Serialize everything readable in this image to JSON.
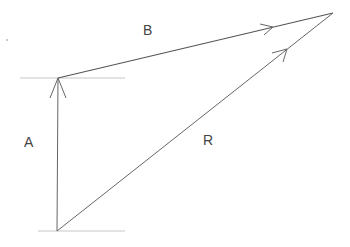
{
  "diagram": {
    "colors": {
      "vector": "#555555",
      "guide": "#bbbbbb",
      "text": "#444444"
    },
    "points": {
      "origin": [
        57,
        231
      ],
      "a_tip": [
        58,
        78
      ],
      "apex": [
        333,
        13
      ]
    },
    "vectors": [
      {
        "id": "A",
        "label": "A",
        "from": "origin",
        "to": "a_tip",
        "label_pos": [
          29,
          142
        ]
      },
      {
        "id": "B",
        "label": "B",
        "from": "a_tip",
        "to": "apex",
        "label_pos": [
          148,
          30
        ]
      },
      {
        "id": "R",
        "label": "R",
        "from": "origin",
        "to": "apex",
        "label_pos": [
          208,
          140
        ]
      }
    ],
    "guides": [
      {
        "id": "top-guide",
        "x1": 20,
        "x2": 125,
        "y": 78
      },
      {
        "id": "bottom-guide",
        "x1": 38,
        "x2": 125,
        "y": 231
      }
    ]
  }
}
